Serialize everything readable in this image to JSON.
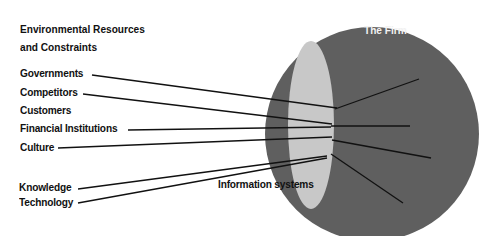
{
  "diagram": {
    "title_line1": "Environmental Resources",
    "title_line2": "and Constraints",
    "firm_label": "The Firm",
    "info_systems_label": "Information systems",
    "environment_items": [
      {
        "label": "Governments"
      },
      {
        "label": "Competitors"
      },
      {
        "label": "Customers"
      },
      {
        "label": "Financial Institutions"
      },
      {
        "label": "Culture"
      },
      {
        "label": "Knowledge"
      },
      {
        "label": "Technology"
      }
    ],
    "colors": {
      "firm_circle": "#5f5f5f",
      "info_systems_ellipse": "#c8c8c8",
      "lines": "#111111",
      "text": "#111111",
      "firm_label": "#f2f2f2"
    }
  }
}
